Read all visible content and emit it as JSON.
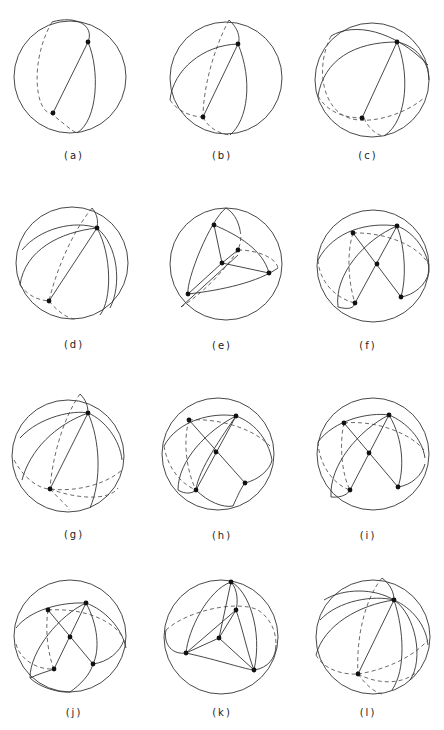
{
  "figure": {
    "running_head": {
      "page_number": "",
      "author": ""
    },
    "panels": [
      {
        "id": "a",
        "label": "(a)",
        "vertices": 2
      },
      {
        "id": "b",
        "label": "(b)",
        "vertices": 2
      },
      {
        "id": "c",
        "label": "(c)",
        "vertices": 2
      },
      {
        "id": "d",
        "label": "(d)",
        "vertices": 2
      },
      {
        "id": "e",
        "label": "(e)",
        "vertices": 5
      },
      {
        "id": "f",
        "label": "(f)",
        "vertices": 5
      },
      {
        "id": "g",
        "label": "(g)",
        "vertices": 2
      },
      {
        "id": "h",
        "label": "(h)",
        "vertices": 5
      },
      {
        "id": "i",
        "label": "(i)",
        "vertices": 5
      },
      {
        "id": "j",
        "label": "(j)",
        "vertices": 5
      },
      {
        "id": "k",
        "label": "(k)",
        "vertices": 5
      },
      {
        "id": "l",
        "label": "(l)",
        "vertices": 2
      }
    ],
    "colors": {
      "line": "#333333",
      "background": "#ffffff",
      "point": "#111111"
    }
  }
}
